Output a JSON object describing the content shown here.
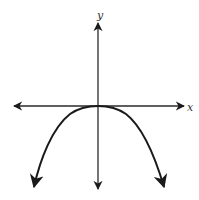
{
  "graph": {
    "x_axis_label": "x",
    "y_axis_label": "y",
    "curve_description": "Downward-opening even-degree polynomial (e.g. y = -x^4) with flat vertex at the origin, both ends pointing down",
    "colors": {
      "axis": "#2a2a2a",
      "curve": "#1a1a1a",
      "background": "#ffffff"
    }
  }
}
